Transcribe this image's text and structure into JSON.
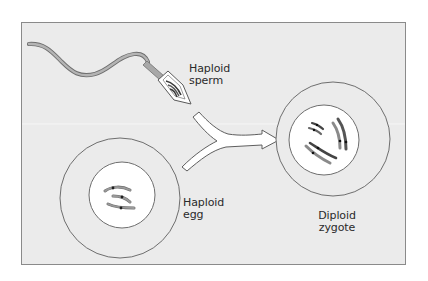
{
  "diagram": {
    "colors": {
      "background": "#ffffff",
      "panel": "#ebebeb",
      "panel_border": "#8a8a8a",
      "outline": "#6e6e6e",
      "nucleus_fill": "#ffffff",
      "chromosome": "#8c8c8c",
      "centromere": "#1e1e1e",
      "arrow_fill": "#ffffff",
      "text": "#2a2a2a"
    },
    "nodes": [
      {
        "id": "sperm",
        "shape": "sperm cell with tail, head containing chromosomes",
        "label_lines": [
          "Haploid",
          "sperm"
        ]
      },
      {
        "id": "egg",
        "shape": "large circle with inner nucleus containing 3 chromosomes",
        "label_lines": [
          "Haploid",
          "egg"
        ]
      },
      {
        "id": "zygote",
        "shape": "large circle with inner nucleus containing paired chromosomes",
        "label_lines": [
          "Diploid",
          "zygote"
        ]
      }
    ],
    "edges": [
      {
        "from": [
          "sperm",
          "egg"
        ],
        "to": "zygote",
        "style": "merging Y-shaped white arrow"
      }
    ]
  },
  "labels": {
    "sperm": {
      "line1": "Haploid",
      "line2": "sperm"
    },
    "egg": {
      "line1": "Haploid",
      "line2": "egg"
    },
    "zygote": {
      "line1": "Diploid",
      "line2": "zygote"
    }
  }
}
